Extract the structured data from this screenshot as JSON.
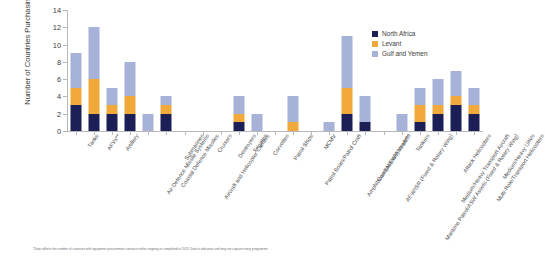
{
  "chart_data": {
    "type": "bar",
    "stacked": true,
    "title": "",
    "xlabel": "",
    "ylabel": "Number of Countries Purchasing",
    "ylim": [
      0,
      14
    ],
    "yticks": [
      0,
      2,
      4,
      6,
      8,
      10,
      12,
      14
    ],
    "grid": false,
    "legend_position": "top-right",
    "colors": {
      "North Africa": "#1c1f55",
      "Levant": "#f2a93b",
      "Gulf and Yemen": "#a7b2d8"
    },
    "categories": [
      "Tanks",
      "AFVs**",
      "Artillery",
      "Air-Defence Missile Systems",
      "Coastal Defence Missiles",
      "Submarines",
      "Aircraft and Helicopter Carriers",
      "Cruisers",
      "Destroyers",
      "Frigates",
      "Corvettes",
      "Patrol Ships",
      "Patrol Boats/Patrol Craft",
      "MCMV",
      "Amphibious (Assault) Vessels",
      "Combat/EW Aircraft***",
      "AEW/ISR (Fixed & Rotary Wing)",
      "Maritime Patrol/ASW Assets (Fixed & Rotary Wing)",
      "Tankers",
      "Medium/Heavy Transport Aircraft",
      "Attack Helicopters",
      "Multi-Role/Transport Helicopters",
      "Medium/Heavy UAVs"
    ],
    "series": [
      {
        "name": "North Africa",
        "values": [
          3,
          2,
          2,
          2,
          0,
          2,
          0,
          0,
          0,
          1,
          0,
          0,
          0,
          0,
          0,
          2,
          1,
          0,
          0,
          1,
          2,
          3,
          2
        ]
      },
      {
        "name": "Levant",
        "values": [
          2,
          4,
          1,
          2,
          0,
          1,
          0,
          0,
          0,
          1,
          0,
          0,
          1,
          0,
          0,
          3,
          0,
          0,
          0,
          2,
          1,
          1,
          1
        ]
      },
      {
        "name": "Gulf and Yemen",
        "values": [
          4,
          6,
          2,
          4,
          2,
          1,
          0,
          0,
          0,
          2,
          2,
          0,
          3,
          0,
          1,
          6,
          3,
          0,
          2,
          2,
          3,
          3,
          2
        ]
      }
    ],
    "totals": [
      9,
      12,
      5,
      8,
      2,
      4,
      0,
      0,
      0,
      4,
      2,
      0,
      4,
      0,
      1,
      11,
      4,
      0,
      2,
      5,
      6,
      7,
      5
    ]
  },
  "legend": {
    "entries": [
      {
        "label": "North Africa",
        "key": "na"
      },
      {
        "label": "Levant",
        "key": "lv"
      },
      {
        "label": "Gulf and Yemen",
        "key": "gy"
      }
    ]
  },
  "footnote": {
    "text": "*Data reflects the number of countries with equipment procurement contracts either ongoing or completed in 2019. Data is indicative and may not capture every programme."
  }
}
